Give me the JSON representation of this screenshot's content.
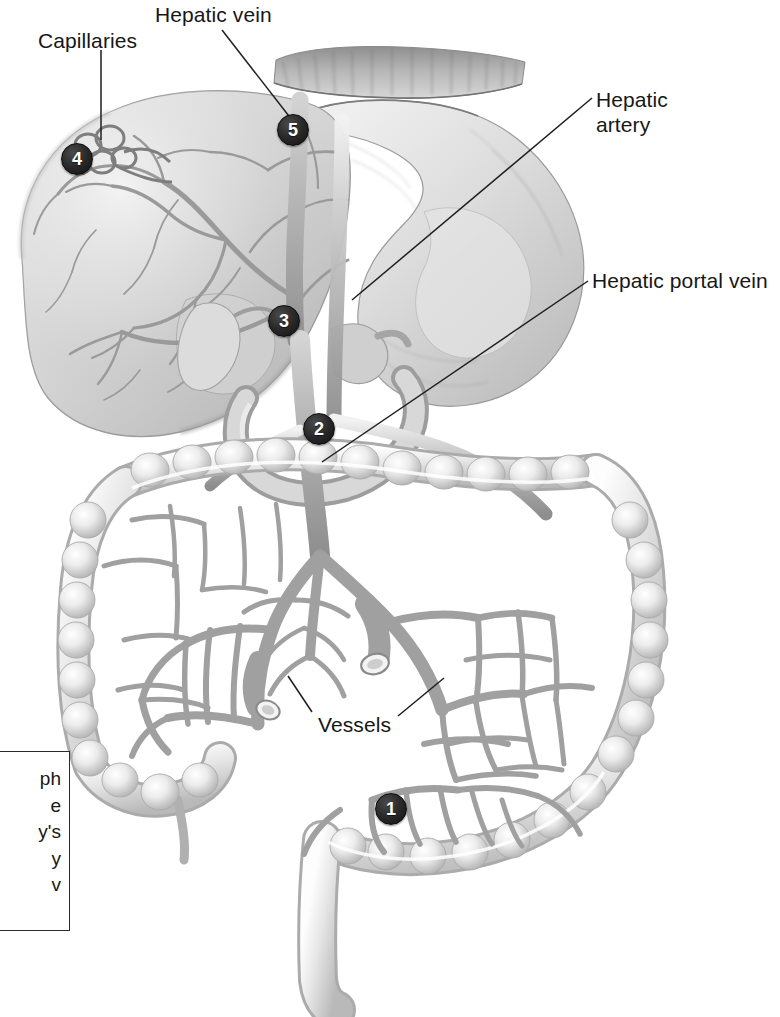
{
  "figure": {
    "style": "grayscale medical illustration",
    "background_color": "#ffffff",
    "marker_color": "#1a1a1a",
    "marker_text_color": "#ffffff",
    "label_text_color": "#171717"
  },
  "labels": [
    {
      "id": "capillaries",
      "text": "Capillaries",
      "x": 38,
      "y": 28
    },
    {
      "id": "hepatic-vein",
      "text": "Hepatic vein",
      "x": 155,
      "y": 2
    },
    {
      "id": "hepatic-artery",
      "text": "Hepatic\nartery",
      "x": 596,
      "y": 87
    },
    {
      "id": "hepatic-artery-l1",
      "text": "Hepatic",
      "x": 596,
      "y": 87
    },
    {
      "id": "hepatic-artery-l2",
      "text": "artery",
      "x": 596,
      "y": 112
    },
    {
      "id": "hepatic-portal-vein",
      "text": "Hepatic portal vein",
      "x": 592,
      "y": 268
    },
    {
      "id": "vessels",
      "text": "Vessels",
      "x": 318,
      "y": 712
    },
    {
      "id": "clipped-left",
      "text": "ss",
      "x": -34,
      "y": 589
    }
  ],
  "markers": [
    {
      "number": "1",
      "x": 375,
      "y": 793,
      "points_to": "intestinal capillary bed / mesenteric vessels"
    },
    {
      "number": "2",
      "x": 303,
      "y": 413,
      "points_to": "hepatic portal vein"
    },
    {
      "number": "3",
      "x": 268,
      "y": 305,
      "points_to": "hepatic artery"
    },
    {
      "number": "4",
      "x": 61,
      "y": 143,
      "points_to": "liver capillaries (sinusoids)"
    },
    {
      "number": "5",
      "x": 277,
      "y": 114,
      "points_to": "hepatic vein"
    }
  ],
  "caption_box": {
    "clipped": true,
    "lines": [
      "ph",
      "e",
      "y's",
      "y",
      "v"
    ]
  },
  "organs": [
    "liver",
    "diaphragm",
    "stomach",
    "gallbladder",
    "duodenum",
    "large intestine",
    "small intestine",
    "rectum",
    "mesenteric vessels"
  ]
}
